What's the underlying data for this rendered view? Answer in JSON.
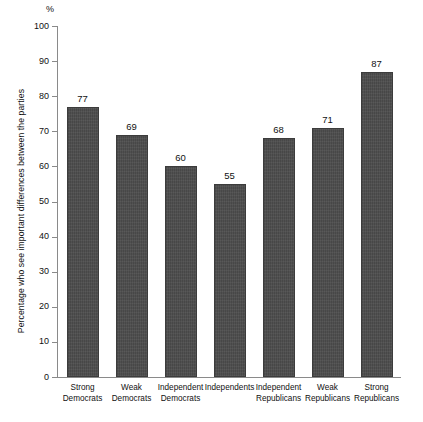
{
  "chart_data": {
    "type": "bar",
    "title": "",
    "subtitle": "",
    "xlabel": "",
    "ylabel": "Percentage who see important differences between the parties",
    "unit_label": "%",
    "ylim": [
      0,
      100
    ],
    "yticks": [
      0,
      10,
      20,
      30,
      40,
      50,
      60,
      70,
      80,
      90,
      100
    ],
    "ytick_labels": [
      "0",
      "10",
      "20",
      "30",
      "40",
      "50",
      "60",
      "70",
      "80",
      "90",
      "100"
    ],
    "grid": false,
    "legend": null,
    "bar_color": "#4b4b4b",
    "background_color": "#ffffff",
    "axis_color": "#8a8a8a",
    "categories": [
      "Strong Democrats",
      "Weak Democrats",
      "Independent Democrats",
      "Independents",
      "Independent Republicans",
      "Weak Republicans",
      "Strong Republicans"
    ],
    "category_lines": [
      [
        "Strong",
        "Democrats"
      ],
      [
        "Weak",
        "Democrats"
      ],
      [
        "Independent",
        "Democrats"
      ],
      [
        "Independents"
      ],
      [
        "Independent",
        "Republicans"
      ],
      [
        "Weak",
        "Republicans"
      ],
      [
        "Strong",
        "Republicans"
      ]
    ],
    "values": [
      77,
      69,
      60,
      55,
      68,
      71,
      87
    ],
    "value_labels": [
      "77",
      "69",
      "60",
      "55",
      "68",
      "71",
      "87"
    ]
  }
}
